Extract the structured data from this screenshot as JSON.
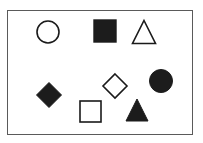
{
  "figure": {
    "canvas": {
      "width": 203,
      "height": 143
    },
    "background_color": "#ffffff",
    "frame": {
      "name": "outer-rectangle-border",
      "x": 7,
      "y": 10,
      "width": 186,
      "height": 125,
      "stroke_color": "#5a5a5a",
      "stroke_width": 1,
      "fill": "none"
    },
    "shape_count": 8,
    "outlined_count": 4,
    "filled_count": 4,
    "stroke_color": "#1a1a1a",
    "fill_color": "#1c1c1c",
    "shapes": [
      {
        "id": "circle-outline",
        "label": "Open circle",
        "type": "circle",
        "style": "outline",
        "cx": 48,
        "cy": 32,
        "r": 11,
        "stroke": "#1a1a1a",
        "stroke_width": 1.6,
        "fill": "none",
        "row": 1,
        "column": 1
      },
      {
        "id": "square-filled",
        "label": "Filled square",
        "type": "square",
        "style": "filled",
        "x": 94,
        "y": 20,
        "size": 22,
        "stroke": "#1c1c1c",
        "stroke_width": 1.4,
        "fill": "#1c1c1c",
        "row": 1,
        "column": 2
      },
      {
        "id": "triangle-outline",
        "label": "Open triangle",
        "type": "triangle",
        "style": "outline",
        "cx": 144,
        "cy": 32,
        "size": 23,
        "stroke": "#1a1a1a",
        "stroke_width": 1.6,
        "fill": "none",
        "row": 1,
        "column": 3
      },
      {
        "id": "circle-filled",
        "label": "Filled circle",
        "type": "circle",
        "style": "filled",
        "cx": 161,
        "cy": 81,
        "r": 11.5,
        "stroke": "#1c1c1c",
        "stroke_width": 1,
        "fill": "#1c1c1c",
        "row": 2,
        "column": 3
      },
      {
        "id": "diamond-outline",
        "label": "Open diamond",
        "type": "diamond",
        "style": "outline",
        "cx": 115,
        "cy": 86,
        "r": 12,
        "stroke": "#1a1a1a",
        "stroke_width": 1.6,
        "fill": "none",
        "row": 2,
        "column": 2
      },
      {
        "id": "diamond-filled",
        "label": "Filled diamond",
        "type": "diamond",
        "style": "filled",
        "cx": 49,
        "cy": 95,
        "r": 12.5,
        "stroke": "#1c1c1c",
        "stroke_width": 1,
        "fill": "#1c1c1c",
        "row": 2,
        "column": 1
      },
      {
        "id": "square-outline",
        "label": "Open square",
        "type": "square",
        "style": "outline",
        "x": 80,
        "y": 101,
        "size": 21,
        "stroke": "#1a1a1a",
        "stroke_width": 1.6,
        "fill": "none",
        "row": 3,
        "column": 2
      },
      {
        "id": "triangle-filled",
        "label": "Filled triangle",
        "type": "triangle",
        "style": "filled",
        "cx": 137,
        "cy": 110,
        "size": 22,
        "stroke": "#1c1c1c",
        "stroke_width": 1,
        "fill": "#1c1c1c",
        "row": 3,
        "column": 3
      }
    ]
  }
}
